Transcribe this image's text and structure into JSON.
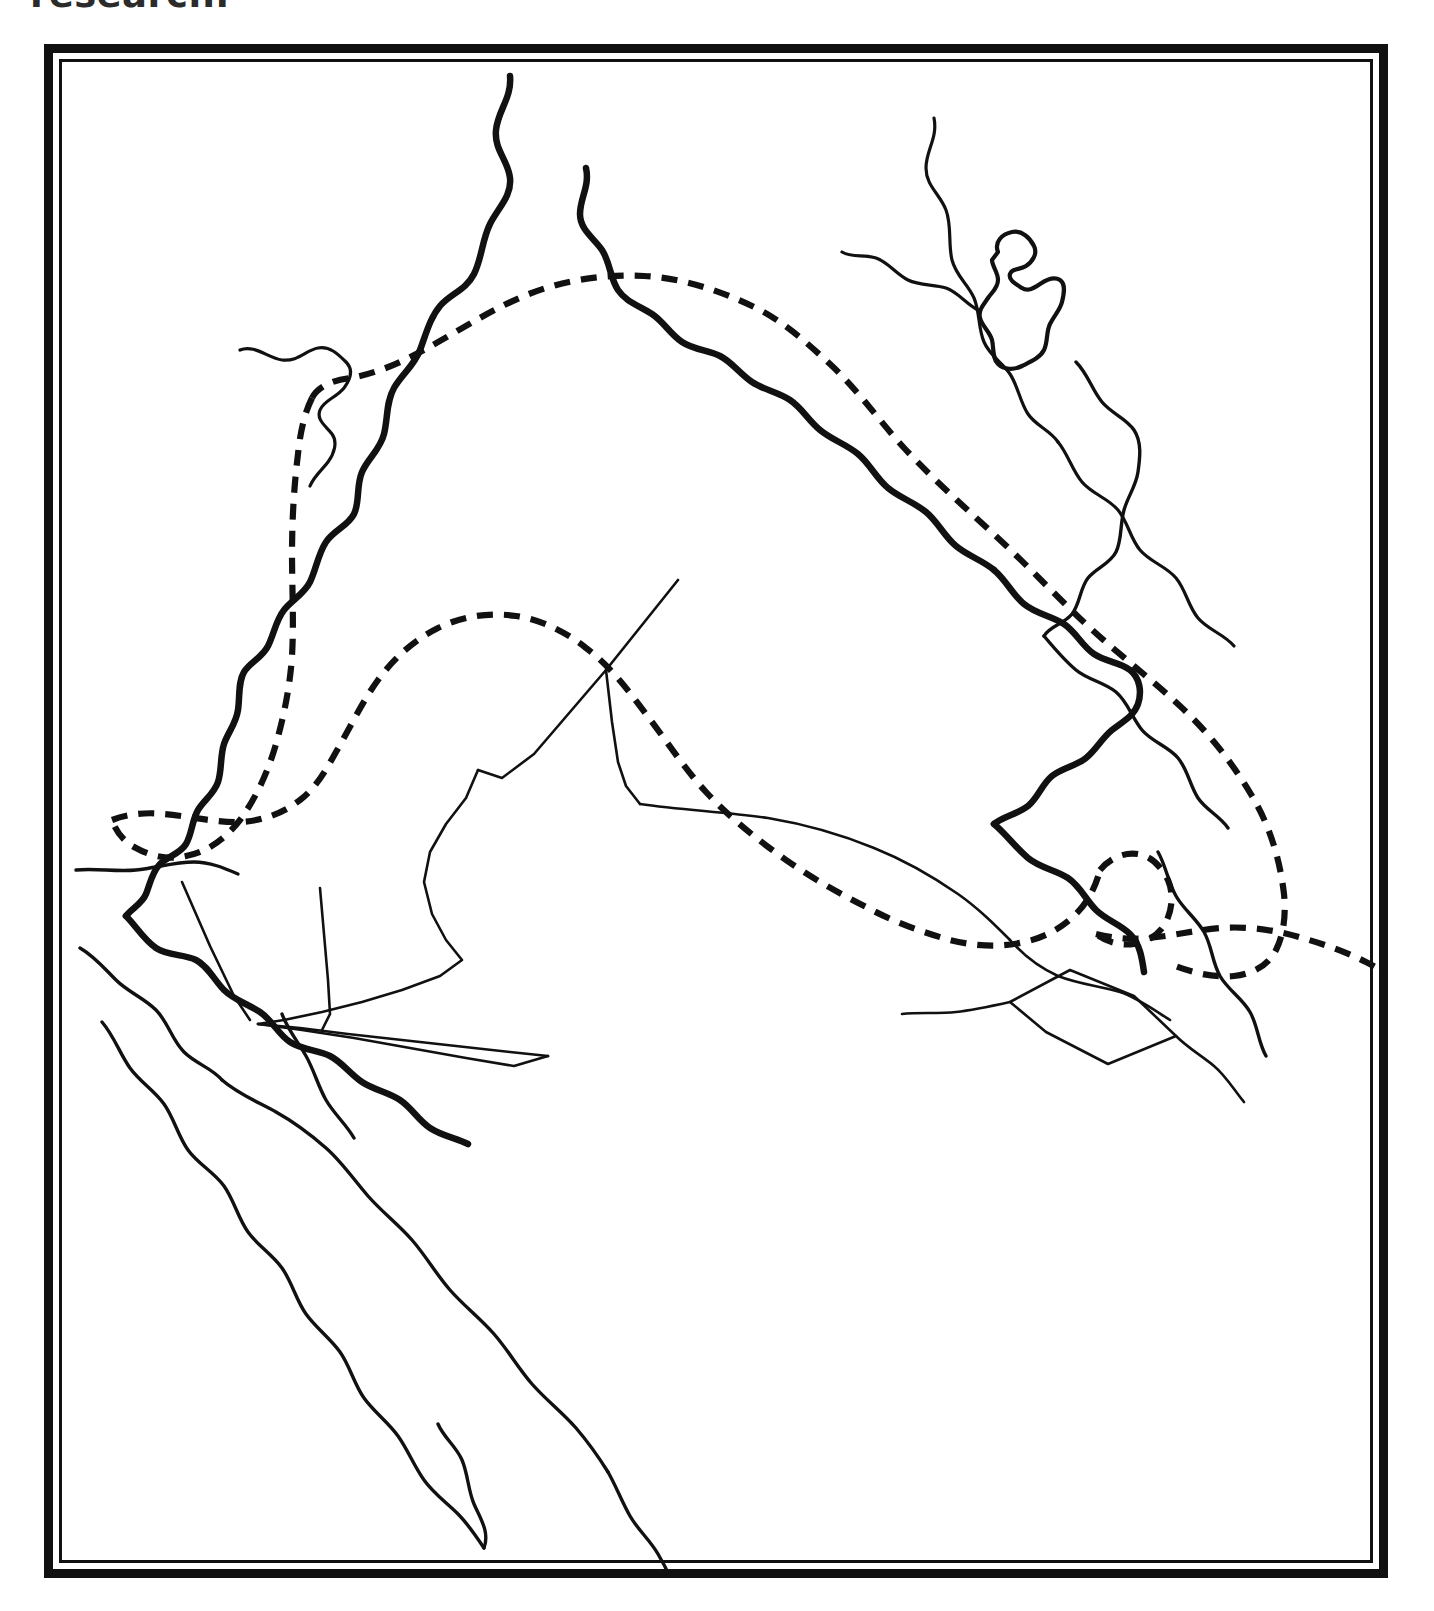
{
  "page": {
    "caption_fragment": "research.",
    "background_color": "#ffffff",
    "ink_color": "#111111"
  },
  "figure": {
    "name": "outline-map",
    "frame": {
      "style": "double-rule",
      "outer_rule_color": "#111111",
      "inner_rule_color": "#111111",
      "outer_rule_width_px": 9,
      "inner_rule_width_px": 3,
      "left_px": 44,
      "top_px": 44,
      "width_px": 1344,
      "height_px": 1534
    },
    "title": "",
    "legend": [],
    "labels": [],
    "line_types": [
      {
        "key": "river-major",
        "description": "thick solid river course",
        "stroke_width": 6.5,
        "dashed": false
      },
      {
        "key": "river-minor",
        "description": "thin solid tributary",
        "stroke_width": 3.2,
        "dashed": false
      },
      {
        "key": "coast-line",
        "description": "thin solid coastline",
        "stroke_width": 3.4,
        "dashed": false
      },
      {
        "key": "lake-shape",
        "description": "closed lake outline",
        "stroke_width": 4.2,
        "dashed": false
      },
      {
        "key": "border-line",
        "description": "thin solid political border",
        "stroke_width": 2.6,
        "dashed": false
      },
      {
        "key": "dashed-zone",
        "description": "heavy dashed zone boundary",
        "stroke_width": 6.2,
        "dashed": true
      }
    ],
    "features": [
      {
        "name": "river-upper-left-tributary",
        "type": "river-minor",
        "d": "M 178 288 C 192 282 206 296 220 298 C 236 300 244 288 256 286 C 268 284 276 292 284 300 C 292 308 288 318 282 326 C 274 336 262 338 258 348 C 254 358 264 364 270 372 C 276 380 272 392 266 400 C 260 408 252 414 248 424"
      },
      {
        "name": "euphrates-river",
        "type": "river-major",
        "d": "M 448 14 C 450 36 436 48 434 68 C 432 88 446 98 448 116 C 450 134 436 146 428 162 C 420 178 420 196 412 212 C 404 228 388 232 378 244 C 368 256 364 272 358 288 C 352 304 340 312 332 326 C 324 340 326 356 322 372 C 318 388 306 396 300 410 C 294 424 298 440 292 452 C 286 464 272 468 264 480 C 256 492 254 508 248 520 C 242 532 230 538 222 548 C 214 558 212 572 206 584 C 200 596 188 600 182 610 C 176 620 178 634 176 648 C 174 662 166 670 162 682 C 158 694 160 708 156 720 C 152 732 142 738 136 748 C 130 758 130 772 124 782 C 118 792 106 794 98 802 C 90 810 88 822 84 832 C 80 842 70 846 64 854"
      },
      {
        "name": "euphrates-lower-course",
        "type": "river-major",
        "d": "M 64 854 C 74 864 82 878 94 886 C 106 894 122 892 134 898 C 146 904 152 918 162 928 C 172 938 186 942 198 950 C 210 958 216 972 228 980 C 240 988 256 988 268 994 C 280 1000 288 1012 300 1020 C 312 1028 326 1030 338 1038 C 350 1046 356 1058 368 1066 C 380 1074 394 1076 406 1082"
      },
      {
        "name": "tigris-river-upper",
        "type": "river-major",
        "d": "M 524 106 C 528 124 518 136 518 152 C 518 168 532 176 540 188 C 548 200 548 216 556 228 C 564 240 578 244 590 252 C 602 260 608 272 620 280 C 632 288 646 288 658 294 C 670 300 678 312 690 320 C 702 328 716 330 728 338 C 740 346 746 358 758 368 C 770 378 784 382 796 392 C 808 402 814 416 826 426 C 838 436 852 440 864 450 C 876 460 882 474 894 484 C 906 494 920 498 932 508"
      },
      {
        "name": "tigris-river-lower",
        "type": "river-major",
        "d": "M 932 508 C 944 518 950 532 962 542 C 974 552 990 554 1002 562 C 1014 570 1020 584 1032 592 C 1044 600 1058 600 1068 608 C 1078 616 1080 630 1076 642 C 1072 654 1060 660 1050 668 C 1040 676 1034 688 1024 696 C 1014 704 1000 706 990 714 C 980 722 976 736 966 744 C 956 752 942 754 932 762"
      },
      {
        "name": "shatt-al-arab",
        "type": "river-major",
        "d": "M 932 762 C 944 772 954 786 966 796 C 978 806 994 808 1006 816 C 1018 824 1024 838 1034 848 C 1044 858 1058 862 1068 872 C 1078 882 1080 896 1082 910"
      },
      {
        "name": "zab-tributary-north",
        "type": "river-minor",
        "d": "M 872 56 C 876 76 864 88 864 106 C 864 124 878 132 884 148 C 890 164 886 182 890 198 C 894 214 906 222 912 236 C 918 250 916 266 922 280 C 928 294 940 300 948 312 C 956 324 958 340 966 352 C 974 364 988 368 996 380"
      },
      {
        "name": "zagros-foothill-stream",
        "type": "river-minor",
        "d": "M 996 380 C 1006 392 1010 408 1020 420 C 1030 432 1046 436 1056 448 C 1066 460 1068 476 1078 488 C 1088 500 1104 504 1114 516 C 1124 528 1126 544 1136 556 C 1146 568 1162 572 1172 584"
      },
      {
        "name": "eastern-stream-upper",
        "type": "river-minor",
        "d": "M 780 190 C 790 196 802 192 814 196 C 826 200 834 212 846 218 C 858 224 872 222 884 226 C 896 230 904 242 916 248"
      },
      {
        "name": "lake-urmia-outline",
        "type": "lake-shape",
        "d": "M 936 190 C 932 180 940 172 950 170 C 960 168 968 176 972 184 C 976 192 970 200 964 204 C 958 208 950 206 948 212 C 946 218 954 222 960 226 C 966 230 972 226 978 222 C 984 218 992 214 998 218 C 1004 222 1002 232 1000 240 C 998 248 992 254 988 262 C 984 270 986 280 982 288 C 978 296 968 300 960 304 C 952 308 942 308 936 302 C 930 296 932 286 930 278 C 928 270 920 264 918 256 C 916 248 922 242 926 236 C 930 230 936 226 936 218 C 936 210 930 204 930 198 Z"
      },
      {
        "name": "east-coast-line",
        "type": "coast-line",
        "d": "M 1014 300 C 1026 312 1030 328 1040 340 C 1050 352 1064 356 1072 368 C 1080 380 1078 396 1076 410 C 1074 424 1066 434 1062 448 C 1058 462 1060 478 1054 490 C 1048 502 1034 506 1026 516 C 1018 526 1018 542 1010 552 C 1002 562 988 564 982 574"
      },
      {
        "name": "persian-gulf-east-coast",
        "type": "coast-line",
        "d": "M 982 574 C 992 586 1002 598 1014 608 C 1026 618 1042 620 1054 630 C 1066 640 1070 656 1080 668 C 1090 680 1106 684 1116 696 C 1126 708 1128 724 1136 736 C 1144 748 1158 754 1166 766"
      },
      {
        "name": "gulf-coast-iran-side",
        "type": "coast-line",
        "d": "M 1096 790 C 1104 804 1106 820 1114 834 C 1122 848 1134 856 1142 870 C 1150 884 1150 900 1158 914 C 1166 928 1180 936 1188 950 C 1196 964 1196 980 1204 994"
      },
      {
        "name": "dashed-boundary-north-upper",
        "type": "dashed-zone",
        "d": "M 250 336 C 256 324 272 318 288 316 C 312 312 336 302 358 290 C 392 272 424 250 462 234 C 500 218 542 212 582 214 C 620 216 656 228 690 244 C 720 258 744 280 768 302 C 796 328 818 360 844 388 C 874 420 906 448 938 478 C 968 506 996 536 1026 564 C 1056 592 1088 616 1118 644 C 1146 670 1170 700 1190 734 C 1208 764 1218 798 1222 832 C 1224 852 1222 872 1214 888 C 1206 904 1190 912 1172 914 C 1150 916 1128 910 1108 902"
      },
      {
        "name": "dashed-boundary-west-branch",
        "type": "dashed-zone",
        "d": "M 250 336 C 242 352 238 372 236 392 C 232 424 230 458 230 492 C 230 526 232 560 230 594 C 228 624 222 654 214 682 C 206 710 194 736 178 758 C 164 776 146 790 124 794 C 106 798 88 794 74 786 C 62 780 54 770 50 758"
      },
      {
        "name": "dashed-boundary-central",
        "type": "dashed-zone",
        "d": "M 50 758 C 66 752 84 750 102 752 C 126 754 150 760 174 760 C 198 760 220 752 238 738 C 254 726 264 708 274 690 C 288 666 300 640 316 618 C 332 596 352 578 376 566 C 400 554 428 550 454 554 C 480 558 504 570 524 586 C 548 604 566 628 584 652 C 604 678 622 706 644 730 C 668 756 696 778 724 798 C 750 816 778 832 806 846 C 832 860 860 870 888 878 C 912 884 938 886 962 880 C 982 876 1000 866 1014 852 C 1026 840 1034 824 1038 808"
      },
      {
        "name": "dashed-boundary-gulf-loop",
        "type": "dashed-zone",
        "d": "M 1038 808 C 1048 796 1062 790 1076 792 C 1090 794 1100 806 1106 818 C 1112 832 1110 848 1104 860 C 1098 872 1086 880 1072 882 C 1058 884 1044 880 1034 872"
      },
      {
        "name": "dashed-boundary-southeast-exit",
        "type": "dashed-zone",
        "d": "M 1034 872 C 1050 876 1068 878 1086 876 C 1110 874 1134 868 1158 866 C 1186 864 1214 868 1240 876 C 1262 882 1284 890 1304 900 C 1312 904 1318 908 1326 912"
      },
      {
        "name": "border-syria-iraq-north",
        "type": "border-line",
        "d": "M 616 518 L 544 608 L 472 692 L 440 716 L 416 708"
      },
      {
        "name": "border-jordan-iraq-vertical",
        "type": "border-line",
        "d": "M 544 608 L 550 660 L 556 700 L 564 724 L 578 742"
      },
      {
        "name": "border-iraq-saudi",
        "type": "border-line",
        "d": "M 578 742 C 620 748 664 750 706 756 C 742 762 778 772 812 786 C 842 798 870 814 896 832 C 916 846 932 862 948 878"
      },
      {
        "name": "border-jordan-saudi-west",
        "type": "border-line",
        "d": "M 416 708 L 404 736 L 384 762 L 368 790 L 362 820 L 370 852 L 384 878 L 400 898 L 378 914 L 340 928 L 300 940 L 260 950 L 222 958 L 196 962"
      },
      {
        "name": "border-neutral-zone-line-a",
        "type": "border-line",
        "d": "M 196 962 L 238 966 L 286 972 L 340 978 L 394 984 L 448 990 L 486 994"
      },
      {
        "name": "border-neutral-zone-line-b",
        "type": "border-line",
        "d": "M 196 962 L 240 968 L 292 976 L 348 986 L 404 996 L 452 1004 L 486 994"
      },
      {
        "name": "border-jordan-north-spur",
        "type": "border-line",
        "d": "M 120 820 L 148 884 L 172 934 L 188 958"
      },
      {
        "name": "border-neutral-zone-spur",
        "type": "border-line",
        "d": "M 258 826 L 262 872 L 266 918 L 268 952 L 260 968"
      },
      {
        "name": "border-iraq-saudi-east",
        "type": "border-line",
        "d": "M 948 878 C 962 894 978 906 996 914 C 1016 922 1038 924 1058 930 C 1076 936 1092 948 1108 958"
      },
      {
        "name": "border-neutral-diamond",
        "type": "border-line",
        "d": "M 948 940 L 1008 908 L 1072 934 L 1114 974 L 1046 1002 L 984 970 Z"
      },
      {
        "name": "border-saudi-gulf-south",
        "type": "border-line",
        "d": "M 948 940 C 930 944 912 948 894 950 C 876 952 856 950 840 952"
      },
      {
        "name": "border-qatar-spur",
        "type": "border-line",
        "d": "M 1114 974 C 1126 986 1140 994 1152 1004 C 1164 1014 1172 1028 1182 1040"
      },
      {
        "name": "mediterranean-coast-entry",
        "type": "coast-line",
        "d": "M 14 808 C 34 806 54 810 74 808 C 94 806 112 800 132 800 C 148 800 162 806 176 812"
      },
      {
        "name": "red-sea-west-coast",
        "type": "coast-line",
        "d": "M 40 960 C 52 974 58 992 68 1006 C 78 1020 92 1028 102 1042 C 112 1056 116 1074 126 1088 C 136 1102 152 1110 162 1124 C 172 1138 176 1156 186 1170 C 196 1184 210 1192 220 1206 C 230 1220 234 1238 244 1252 C 254 1266 268 1276 278 1290 C 288 1304 292 1322 302 1336 C 312 1350 326 1360 336 1374 C 346 1388 352 1404 362 1418 C 372 1432 384 1440 396 1452 C 406 1462 414 1474 422 1486"
      },
      {
        "name": "red-sea-east-coast",
        "type": "coast-line",
        "d": "M 18 886 C 32 894 42 906 54 918 C 66 930 82 936 94 948 C 106 960 110 978 122 990 C 134 1002 150 1006 160 1018"
      },
      {
        "name": "arabian-interior-line",
        "type": "coast-line",
        "d": "M 160 1018 C 176 1032 196 1040 214 1050 C 232 1060 248 1072 264 1086 C 280 1100 292 1118 306 1134 C 320 1150 336 1162 350 1178 C 364 1194 374 1212 388 1228 C 402 1244 418 1256 432 1272 C 446 1288 456 1306 470 1322 C 484 1338 500 1350 514 1366 C 526 1380 536 1394 546 1410"
      },
      {
        "name": "arabian-interior-lower",
        "type": "coast-line",
        "d": "M 546 1410 C 554 1424 560 1440 568 1454 C 576 1468 588 1478 596 1492 C 602 1502 606 1510 610 1520"
      },
      {
        "name": "red-sea-coast-tail",
        "type": "coast-line",
        "d": "M 422 1486 C 428 1470 418 1456 412 1442 C 406 1428 406 1412 400 1398 C 394 1384 382 1376 376 1362"
      },
      {
        "name": "wadi-line-lower",
        "type": "coast-line",
        "d": "M 220 952 C 226 968 236 980 244 994 C 252 1008 256 1024 264 1038 C 272 1052 284 1062 292 1076"
      }
    ]
  }
}
